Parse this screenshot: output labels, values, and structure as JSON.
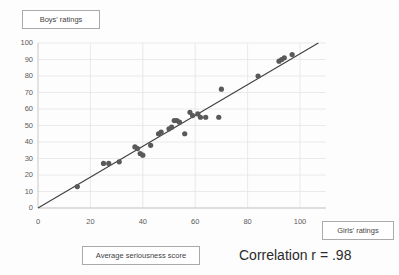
{
  "chart_data": {
    "type": "scatter",
    "title": "",
    "xlabel": "Average seriousness score",
    "ylabel": "Boys' ratings",
    "series_label": "Girls' ratings",
    "annotation": "Correlation r = .98",
    "correlation": 0.98,
    "xlim": [
      0,
      100
    ],
    "ylim": [
      0,
      100
    ],
    "xticks": [
      0,
      20,
      40,
      60,
      80,
      100
    ],
    "yticks": [
      0,
      10,
      20,
      30,
      40,
      50,
      60,
      70,
      80,
      90,
      100
    ],
    "grid": "horizontal-every-10-vertical-every-20",
    "legend": "none",
    "point_color": "#595959",
    "line_color": "#3f3f3f",
    "grid_color": "#e4e4e4",
    "axis_color": "#c9c9c9",
    "trendline": {
      "x0": 0,
      "y0": 0,
      "x1": 107,
      "y1": 100
    },
    "points": [
      {
        "x": 15,
        "y": 13
      },
      {
        "x": 25,
        "y": 27
      },
      {
        "x": 27,
        "y": 27
      },
      {
        "x": 31,
        "y": 28
      },
      {
        "x": 37,
        "y": 37
      },
      {
        "x": 38,
        "y": 36
      },
      {
        "x": 39,
        "y": 33
      },
      {
        "x": 40,
        "y": 32
      },
      {
        "x": 43,
        "y": 38
      },
      {
        "x": 46,
        "y": 45
      },
      {
        "x": 47,
        "y": 46
      },
      {
        "x": 50,
        "y": 48
      },
      {
        "x": 51,
        "y": 49
      },
      {
        "x": 52,
        "y": 53
      },
      {
        "x": 53,
        "y": 53
      },
      {
        "x": 54,
        "y": 52
      },
      {
        "x": 56,
        "y": 45
      },
      {
        "x": 58,
        "y": 58
      },
      {
        "x": 59,
        "y": 56
      },
      {
        "x": 61,
        "y": 57
      },
      {
        "x": 62,
        "y": 55
      },
      {
        "x": 64,
        "y": 55
      },
      {
        "x": 69,
        "y": 55
      },
      {
        "x": 70,
        "y": 72
      },
      {
        "x": 84,
        "y": 80
      },
      {
        "x": 92,
        "y": 89
      },
      {
        "x": 93,
        "y": 90
      },
      {
        "x": 94,
        "y": 91
      },
      {
        "x": 97,
        "y": 93
      }
    ]
  },
  "labels": {
    "y_axis_box": "Boys' ratings",
    "x_axis_box": "Average seriousness score",
    "series_box": "Girls' ratings",
    "correlation_text": "Correlation r = .98"
  }
}
